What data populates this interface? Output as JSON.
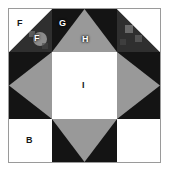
{
  "figure": {
    "name": "quilt-block-diagram",
    "border_color": "#9a9a9a",
    "background_color": "#ffffff"
  },
  "palette": {
    "light": "#ffffff",
    "medium": "#999999",
    "dark": "#141414",
    "outline": "#9a9a9a"
  },
  "labels": {
    "f_light": "F",
    "f_dark": "F",
    "g": "G",
    "h": "H",
    "i": "I",
    "b": "B"
  },
  "grid": {
    "rows": 3,
    "columns": 3,
    "cells": [
      {
        "position": "top-left",
        "name": "half-square-triangle-unit",
        "patches": [
          {
            "label": "F",
            "shade": "light",
            "shape": "triangle",
            "points": "upper-left"
          },
          {
            "label": "F",
            "shade": "dark",
            "shape": "triangle",
            "points": "lower-right"
          }
        ]
      },
      {
        "position": "top-center",
        "name": "flying-geese-unit-up",
        "patches": [
          {
            "label": "G",
            "shade": "dark",
            "shape": "background"
          },
          {
            "label": "H",
            "shade": "medium",
            "shape": "triangle",
            "points": "up"
          }
        ]
      },
      {
        "position": "top-right",
        "name": "half-square-triangle-unit",
        "patches": [
          {
            "label": "",
            "shade": "light",
            "shape": "triangle",
            "points": "upper-right"
          },
          {
            "label": "",
            "shade": "dark",
            "shape": "triangle",
            "points": "lower-left"
          }
        ]
      },
      {
        "position": "middle-left",
        "name": "flying-geese-unit-left",
        "patches": [
          {
            "label": "",
            "shade": "dark",
            "shape": "background"
          },
          {
            "label": "",
            "shade": "medium",
            "shape": "triangle",
            "points": "left"
          }
        ]
      },
      {
        "position": "center",
        "name": "center-square",
        "patches": [
          {
            "label": "I",
            "shade": "light",
            "shape": "square"
          }
        ]
      },
      {
        "position": "middle-right",
        "name": "flying-geese-unit-right",
        "patches": [
          {
            "label": "",
            "shade": "dark",
            "shape": "background"
          },
          {
            "label": "",
            "shade": "medium",
            "shape": "triangle",
            "points": "right"
          }
        ]
      },
      {
        "position": "bottom-left",
        "name": "corner-square",
        "patches": [
          {
            "label": "B",
            "shade": "light",
            "shape": "square"
          }
        ]
      },
      {
        "position": "bottom-center",
        "name": "flying-geese-unit-down",
        "patches": [
          {
            "label": "",
            "shade": "dark",
            "shape": "background"
          },
          {
            "label": "",
            "shade": "medium",
            "shape": "triangle",
            "points": "down"
          }
        ]
      },
      {
        "position": "bottom-right",
        "name": "corner-square",
        "patches": [
          {
            "label": "",
            "shade": "light",
            "shape": "square"
          }
        ]
      }
    ]
  }
}
